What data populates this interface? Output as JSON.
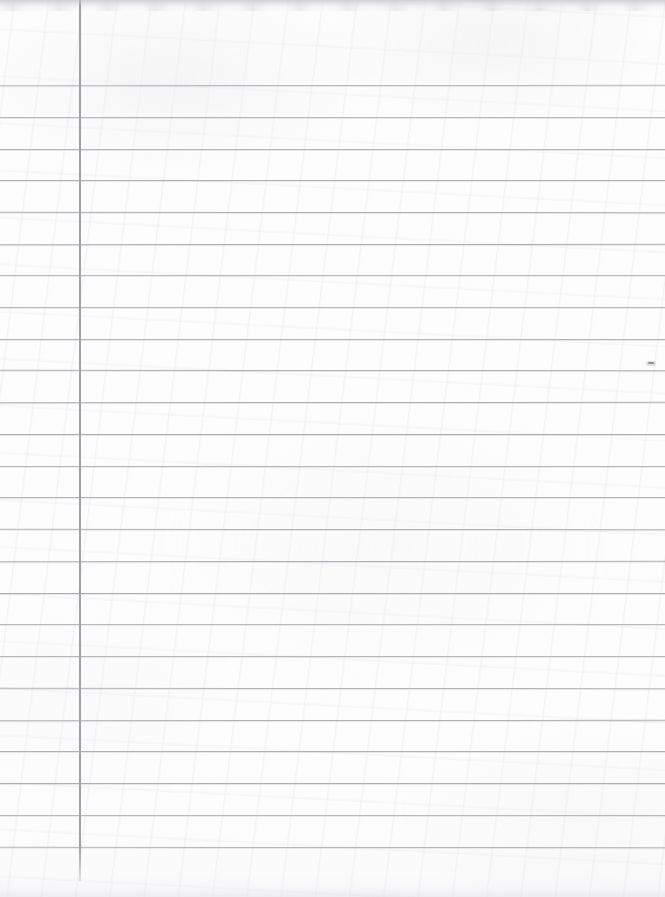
{
  "document": {
    "kind": "scanned-ruled-paper",
    "title": "Blank lined notebook page",
    "width": 665,
    "height": 897,
    "is_blank": true,
    "handwriting_present": false,
    "printed_text_present": false
  },
  "colors": {
    "paper_background": "#fdfdfd",
    "rule_line": "#a9a9b0",
    "margin_line": "#9fa0a8",
    "top_edge_shadow": "#c4c4ca",
    "speck": "#6d6d74"
  },
  "ruling": {
    "style": "wide-ruled",
    "line_count": 25,
    "line_spacing_px": 31.8,
    "first_line_y": 85,
    "line_thickness_px": 1,
    "line_left_x": 0,
    "line_right_x": 665,
    "line_y_positions": [
      85,
      117,
      149,
      180,
      212,
      244,
      275,
      307,
      339,
      370,
      402,
      434,
      466,
      497,
      529,
      561,
      593,
      624,
      656,
      688,
      720,
      751,
      783,
      815,
      847
    ]
  },
  "margin": {
    "present": true,
    "orientation": "vertical",
    "x": 79,
    "top_y": 0,
    "bottom_y": 881,
    "thickness_px": 2
  },
  "artifacts": {
    "top_edge_shadow": {
      "present": true,
      "y": 0,
      "height": 11
    },
    "specks": [
      {
        "name": "right-margin-smudge",
        "x": 648,
        "y": 362,
        "width": 6,
        "height": 2
      }
    ]
  }
}
